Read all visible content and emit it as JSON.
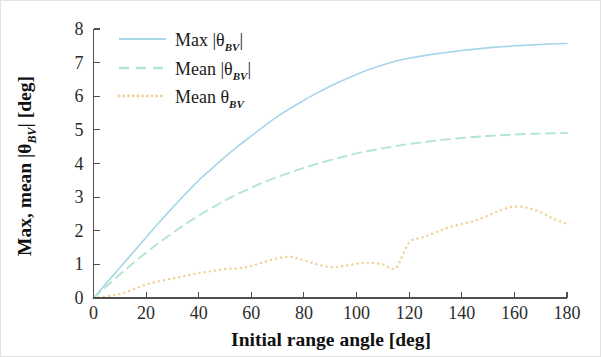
{
  "figure": {
    "background_color": "#ffffff",
    "border_color": "#e2e2e2"
  },
  "chart_data": {
    "type": "line",
    "title": "",
    "xlabel": "Initial range angle [deg]",
    "ylabel": "Max, mean |θBV| [deg]",
    "ylabel_parts": {
      "prefix": "Max, mean |θ",
      "subscript": "BV",
      "suffix": "| [deg]"
    },
    "xlabel_parts": {
      "text": "Initial range angle [deg]"
    },
    "xlim": [
      0,
      180
    ],
    "ylim": [
      0,
      8
    ],
    "xticks": [
      0,
      20,
      40,
      60,
      80,
      100,
      120,
      140,
      160,
      180
    ],
    "xticklabels": [
      "0",
      "20",
      "40",
      "60",
      "80",
      "100",
      "120",
      "140",
      "160",
      "180"
    ],
    "yticks": [
      0,
      1,
      2,
      3,
      4,
      5,
      6,
      7,
      8
    ],
    "yticklabels": [
      "0",
      "1",
      "2",
      "3",
      "4",
      "5",
      "6",
      "7",
      "8"
    ],
    "grid": false,
    "legend_position": "upper-left-inside",
    "x": [
      0,
      5,
      10,
      15,
      20,
      25,
      30,
      35,
      40,
      45,
      50,
      55,
      60,
      65,
      70,
      75,
      80,
      85,
      90,
      95,
      100,
      105,
      110,
      115,
      120,
      125,
      130,
      135,
      140,
      145,
      150,
      155,
      160,
      165,
      170,
      175,
      180
    ],
    "series": [
      {
        "name": "Max |θBV|",
        "label_prefix": "Max",
        "label_symbol": "|θ",
        "label_subscript": "BV",
        "label_suffix": "|",
        "color": "#a6d6e8",
        "linestyle": "solid",
        "linewidth": 1.6,
        "values": [
          0.0,
          0.45,
          0.9,
          1.35,
          1.8,
          2.25,
          2.68,
          3.1,
          3.5,
          3.85,
          4.2,
          4.52,
          4.82,
          5.12,
          5.4,
          5.65,
          5.88,
          6.1,
          6.3,
          6.48,
          6.65,
          6.8,
          6.93,
          7.05,
          7.13,
          7.2,
          7.26,
          7.31,
          7.36,
          7.4,
          7.44,
          7.47,
          7.5,
          7.52,
          7.54,
          7.56,
          7.57
        ]
      },
      {
        "name": "Mean |θBV|",
        "label_prefix": "Mean",
        "label_symbol": "|θ",
        "label_subscript": "BV",
        "label_suffix": "|",
        "color": "#b4e5cf",
        "linestyle": "dashed",
        "linewidth": 1.9,
        "values": [
          0.0,
          0.35,
          0.7,
          1.03,
          1.35,
          1.65,
          1.93,
          2.2,
          2.45,
          2.68,
          2.9,
          3.1,
          3.28,
          3.45,
          3.6,
          3.74,
          3.87,
          3.99,
          4.1,
          4.2,
          4.3,
          4.38,
          4.45,
          4.52,
          4.58,
          4.63,
          4.68,
          4.72,
          4.76,
          4.79,
          4.82,
          4.84,
          4.86,
          4.88,
          4.89,
          4.9,
          4.91
        ]
      },
      {
        "name": "Mean θBV",
        "label_prefix": "Mean",
        "label_symbol": "θ",
        "label_subscript": "BV",
        "label_suffix": "",
        "color": "#f0d298",
        "linestyle": "dotted",
        "linewidth": 2.4,
        "values": [
          0.0,
          0.05,
          0.12,
          0.25,
          0.4,
          0.5,
          0.58,
          0.66,
          0.74,
          0.8,
          0.86,
          0.88,
          0.95,
          1.08,
          1.18,
          1.22,
          1.12,
          1.0,
          0.92,
          0.95,
          1.02,
          1.05,
          1.0,
          0.9,
          0.82,
          0.88,
          0.98,
          1.05,
          1.08,
          1.1,
          1.18,
          1.35,
          1.55,
          1.75,
          1.95,
          2.1,
          2.2
        ]
      }
    ],
    "series_late": {
      "note": "orange continues",
      "x": [
        120,
        125,
        130,
        135,
        140,
        145,
        150,
        155,
        160,
        165,
        170,
        175,
        180
      ],
      "values": [
        1.65,
        1.8,
        1.95,
        2.1,
        2.2,
        2.3,
        2.45,
        2.62,
        2.72,
        2.68,
        2.55,
        2.35,
        2.2
      ]
    }
  }
}
